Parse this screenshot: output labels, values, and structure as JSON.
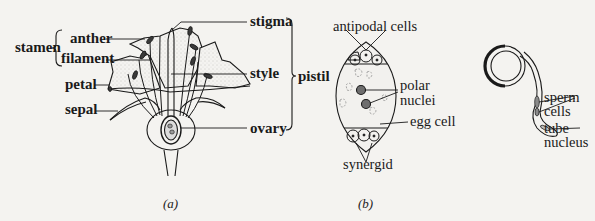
{
  "figure": {
    "panel_a": {
      "caption": "(a)",
      "group_labels": {
        "stamen": "stamen",
        "pistil": "pistil"
      },
      "labels": {
        "anther": "anther",
        "filament": "filament",
        "petal": "petal",
        "sepal": "sepal",
        "stigma": "stigma",
        "style": "style",
        "ovary": "ovary"
      }
    },
    "panel_b": {
      "caption": "(b)",
      "embryo_sac_labels": {
        "antipodal_cells": "antipodal cells",
        "polar_nuclei_line1": "polar",
        "polar_nuclei_line2": "nuclei",
        "egg_cell": "egg cell",
        "synergid": "synergid"
      },
      "pollen_labels": {
        "sperm_cells_line1": "sperm",
        "sperm_cells_line2": "cells",
        "tube_nucleus_line1": "tube",
        "tube_nucleus_line2": "nucleus"
      }
    },
    "colors": {
      "ink": "#1a1a1a",
      "background": "#f4f3f0",
      "stipple": "#9a9a9a",
      "nucleus_fill": "#6e6e6e"
    }
  }
}
